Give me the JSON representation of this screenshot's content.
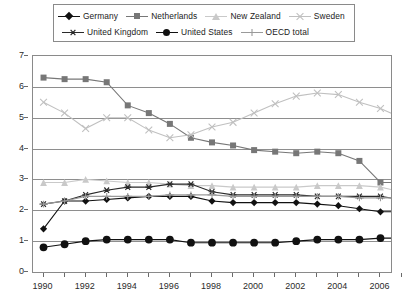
{
  "legend": {
    "position": "top",
    "entries": [
      {
        "label": "Germany",
        "color": "#111111",
        "marker": "diamond",
        "row": 1
      },
      {
        "label": "Netherlands",
        "color": "#777777",
        "marker": "square",
        "row": 1
      },
      {
        "label": "New Zealand",
        "color": "#c9c9c9",
        "marker": "triangle",
        "row": 1
      },
      {
        "label": "Sweden",
        "color": "#c0c0c0",
        "marker": "x",
        "row": 1
      },
      {
        "label": "United Kingdom",
        "color": "#2a2a2a",
        "marker": "asterisk",
        "row": 2
      },
      {
        "label": "United States",
        "color": "#111111",
        "marker": "circle",
        "row": 2
      },
      {
        "label": "OECD total",
        "color": "#9a9a9a",
        "marker": "plus",
        "row": 2
      }
    ]
  },
  "axes": {
    "y_ticks": [
      0,
      1,
      2,
      3,
      4,
      5,
      6,
      7
    ],
    "y_min": 0,
    "y_max": 7,
    "x_ticks": [
      1990,
      1991,
      1992,
      1993,
      1994,
      1995,
      1996,
      1997,
      1998,
      1999,
      2000,
      2001,
      2002,
      2003,
      2004,
      2005,
      2006,
      2007
    ],
    "x_labels": [
      1990,
      1992,
      1994,
      1996,
      1998,
      2000,
      2002,
      2004,
      2006
    ],
    "x_min": 1990,
    "x_max": 2007,
    "grid": "horizontal"
  },
  "chart_data": {
    "type": "line",
    "title": "",
    "xlabel": "",
    "ylabel": "",
    "xlim": [
      1990,
      2007
    ],
    "ylim": [
      0,
      7
    ],
    "grid": true,
    "legend_position": "top",
    "x": [
      1990,
      1991,
      1992,
      1993,
      1994,
      1995,
      1996,
      1997,
      1998,
      1999,
      2000,
      2001,
      2002,
      2003,
      2004,
      2005,
      2006,
      2007
    ],
    "series": [
      {
        "name": "Germany",
        "color": "#111111",
        "marker": "diamond",
        "values": [
          1.4,
          2.3,
          2.3,
          2.35,
          2.4,
          2.45,
          2.45,
          2.45,
          2.3,
          2.25,
          2.25,
          2.25,
          2.25,
          2.2,
          2.15,
          2.05,
          1.95,
          1.95
        ]
      },
      {
        "name": "Netherlands",
        "color": "#777777",
        "marker": "square",
        "values": [
          6.3,
          6.25,
          6.25,
          6.15,
          5.4,
          5.15,
          4.8,
          4.35,
          4.2,
          4.1,
          3.95,
          3.9,
          3.85,
          3.9,
          3.85,
          3.6,
          2.9,
          2.9
        ]
      },
      {
        "name": "New Zealand",
        "color": "#c9c9c9",
        "marker": "triangle",
        "values": [
          2.9,
          2.9,
          3.0,
          2.95,
          2.9,
          2.9,
          2.85,
          2.8,
          2.8,
          2.75,
          2.75,
          2.75,
          2.75,
          2.8,
          2.8,
          2.8,
          2.75,
          2.6
        ]
      },
      {
        "name": "Sweden",
        "color": "#c0c0c0",
        "marker": "x",
        "values": [
          5.5,
          5.15,
          4.65,
          5.0,
          5.0,
          4.6,
          4.35,
          4.45,
          4.7,
          4.85,
          5.15,
          5.45,
          5.7,
          5.8,
          5.75,
          5.5,
          5.3,
          5.0
        ]
      },
      {
        "name": "United Kingdom",
        "color": "#2a2a2a",
        "marker": "asterisk",
        "values": [
          2.2,
          2.3,
          2.5,
          2.65,
          2.75,
          2.75,
          2.85,
          2.85,
          2.6,
          2.5,
          2.5,
          2.5,
          2.5,
          2.45,
          2.45,
          2.45,
          2.45,
          2.35
        ]
      },
      {
        "name": "United States",
        "color": "#111111",
        "marker": "circle",
        "values": [
          0.8,
          0.9,
          1.0,
          1.05,
          1.05,
          1.05,
          1.05,
          0.95,
          0.95,
          0.95,
          0.95,
          0.95,
          1.0,
          1.05,
          1.05,
          1.05,
          1.1,
          1.1
        ]
      },
      {
        "name": "OECD total",
        "color": "#9a9a9a",
        "marker": "plus",
        "values": [
          2.2,
          2.3,
          2.45,
          2.45,
          2.45,
          2.45,
          2.5,
          2.5,
          2.5,
          2.45,
          2.45,
          2.45,
          2.45,
          2.45,
          2.45,
          2.4,
          2.4,
          2.4
        ]
      }
    ]
  }
}
